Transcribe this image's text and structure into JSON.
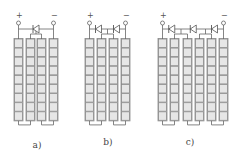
{
  "figure": {
    "colors": {
      "cell_fill": "#e6e6e6",
      "cell_stroke": "#8a8a8a",
      "wire": "#666666",
      "diode": "#555555",
      "label": "#444444"
    },
    "cells_per_column": 9,
    "panels": [
      {
        "id": "a",
        "label": "a)",
        "columns": 4,
        "diodes": 1,
        "positive_terminal": "+",
        "negative_terminal": "−"
      },
      {
        "id": "b",
        "label": "b)",
        "columns": 4,
        "diodes": 2,
        "positive_terminal": "+",
        "negative_terminal": "−"
      },
      {
        "id": "c",
        "label": "c)",
        "columns": 6,
        "diodes": 3,
        "positive_terminal": "+",
        "negative_terminal": "−"
      }
    ]
  }
}
